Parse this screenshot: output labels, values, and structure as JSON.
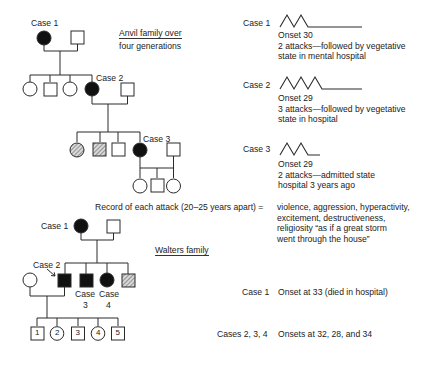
{
  "anvil": {
    "title_line1": "Anvil family over",
    "title_line2": "four generations",
    "labels": {
      "case1": "Case 1",
      "case2": "Case 2",
      "case3": "Case 3"
    },
    "cases": [
      {
        "label": "Case 1",
        "attacks": 2,
        "onset": "Onset 30",
        "desc1": "2 attacks—followed by vegetative",
        "desc2": "state in mental hospital"
      },
      {
        "label": "Case 2",
        "attacks": 3,
        "onset": "Onset 29",
        "desc1": "3 attacks—followed by vegetative",
        "desc2": "state in hospital"
      },
      {
        "label": "Case 3",
        "attacks": 2,
        "onset": "Onset 29",
        "desc1": "2 attacks—admitted state",
        "desc2": "hospital 3 years ago"
      }
    ]
  },
  "record": {
    "label": "Record of each attack (20–25 years apart) =",
    "lines": [
      "violence, aggression, hyperactivity,",
      "excitement, destructiveness,",
      "religiosity “as if a great storm",
      "went through the house”"
    ]
  },
  "walters": {
    "title": "Walters family",
    "labels": {
      "case1": "Case 1",
      "case2": "Case 2",
      "case3a": "Case",
      "case3b": "3",
      "case4a": "Case",
      "case4b": "4"
    },
    "children": [
      "1",
      "2",
      "3",
      "4",
      "5"
    ],
    "notes": [
      {
        "label": "Case 1",
        "text": "Onset at 33 (died in hospital)"
      },
      {
        "label": "Cases 2, 3, 4",
        "text": "Onsets at 32, 28, and 34"
      }
    ]
  },
  "colors": {
    "line": "#2a2a2a",
    "affected": "#111111",
    "hatch": "#777777"
  }
}
